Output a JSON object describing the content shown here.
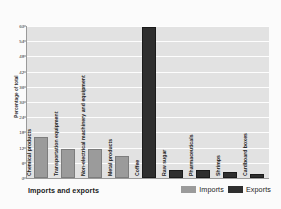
{
  "chart_data": {
    "type": "bar",
    "title": "",
    "xlabel": "Imports and exports",
    "ylabel": "Percentage of total",
    "ylim": [
      0,
      60
    ],
    "yticks": [
      0,
      6,
      12,
      18,
      24,
      30,
      36,
      42,
      48,
      54,
      60
    ],
    "grid": true,
    "legend_position": "bottom-right",
    "categories": [
      "Chemical products",
      "Transportation equipment",
      "Non-electrical machinery and equipment",
      "Metal products",
      "Coffee",
      "Raw sugar",
      "Pharmaceuticals",
      "Shrimps",
      "Cardboard boxes"
    ],
    "series": [
      {
        "name": "Imports",
        "color": "#9b9b9b",
        "values": [
          15.5,
          10.5,
          10.5,
          8.0,
          null,
          null,
          null,
          null,
          null
        ]
      },
      {
        "name": "Exports",
        "color": "#2e2e2e",
        "values": [
          null,
          null,
          null,
          null,
          59.0,
          2.2,
          2.2,
          1.5,
          0.8
        ]
      }
    ],
    "bars": [
      {
        "category": "Chemical products",
        "series": "Imports",
        "value": 15.5
      },
      {
        "category": "Transportation equipment",
        "series": "Imports",
        "value": 10.5
      },
      {
        "category": "Non-electrical machinery and equipment",
        "series": "Imports",
        "value": 10.5
      },
      {
        "category": "Metal products",
        "series": "Imports",
        "value": 8.0
      },
      {
        "category": "Coffee",
        "series": "Exports",
        "value": 59.0
      },
      {
        "category": "Raw sugar",
        "series": "Exports",
        "value": 2.2
      },
      {
        "category": "Pharmaceuticals",
        "series": "Exports",
        "value": 2.2
      },
      {
        "category": "Shrimps",
        "series": "Exports",
        "value": 1.5
      },
      {
        "category": "Cardboard boxes",
        "series": "Exports",
        "value": 0.8
      }
    ]
  },
  "legend": {
    "imports_label": "Imports",
    "exports_label": "Exports"
  },
  "colors": {
    "imports": "#9b9b9b",
    "exports": "#2e2e2e",
    "plot_background": "#e2e2e2",
    "gridline": "#fdfdfd",
    "axis": "#9a9a9a",
    "text": "#1c1c1c"
  }
}
